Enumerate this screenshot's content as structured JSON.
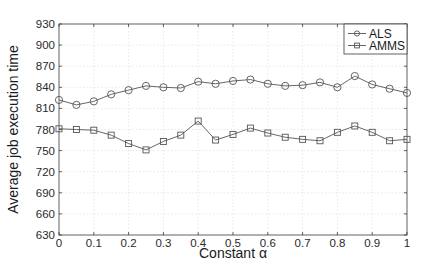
{
  "chart_data": {
    "type": "line",
    "title": "",
    "xlabel": "Constant α",
    "ylabel": "Average job execution time",
    "xlim": [
      0,
      1
    ],
    "ylim": [
      630,
      930
    ],
    "x": [
      0,
      0.05,
      0.1,
      0.15,
      0.2,
      0.25,
      0.3,
      0.35,
      0.4,
      0.45,
      0.5,
      0.55,
      0.6,
      0.65,
      0.7,
      0.75,
      0.8,
      0.85,
      0.9,
      0.95,
      1.0
    ],
    "xticks": [
      0,
      0.1,
      0.2,
      0.3,
      0.4,
      0.5,
      0.6,
      0.7,
      0.8,
      0.9,
      1
    ],
    "xtick_labels": [
      "0",
      "0.1",
      "0.2",
      "0.3",
      "0.4",
      "0.5",
      "0.6",
      "0.7",
      "0.8",
      "0.9",
      "1"
    ],
    "yticks": [
      630,
      660,
      690,
      720,
      750,
      780,
      810,
      840,
      870,
      900,
      930
    ],
    "ytick_labels": [
      "630",
      "660",
      "690",
      "720",
      "750",
      "780",
      "810",
      "840",
      "870",
      "900",
      "930"
    ],
    "grid": true,
    "legend_position": "upper right",
    "series": [
      {
        "name": "ALS",
        "marker": "circle",
        "values": [
          822,
          815,
          820,
          830,
          836,
          842,
          840,
          839,
          848,
          845,
          849,
          851,
          845,
          842,
          843,
          847,
          840,
          856,
          844,
          838,
          832
        ]
      },
      {
        "name": "AMMS",
        "marker": "square",
        "values": [
          781,
          780,
          779,
          772,
          760,
          751,
          763,
          772,
          792,
          765,
          773,
          782,
          775,
          769,
          766,
          764,
          776,
          785,
          776,
          764,
          766
        ]
      }
    ]
  },
  "colors": {
    "line": "#555555",
    "axis": "#3a3a3a",
    "grid": "#d8d8d8",
    "background": "#ffffff"
  }
}
